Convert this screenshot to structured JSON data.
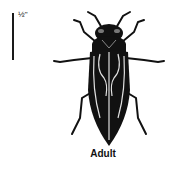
{
  "figure": {
    "scale": {
      "label": "½\""
    },
    "caption": "Adult",
    "colors": {
      "ink": "#111111",
      "background": "#ffffff",
      "highlight": "#e0e0e0"
    }
  }
}
